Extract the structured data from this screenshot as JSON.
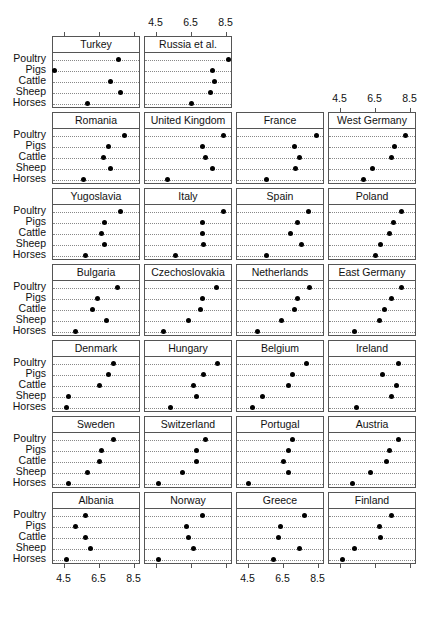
{
  "chart_data": {
    "type": "dot",
    "title": "",
    "xlabel": "",
    "ylabel": "",
    "xlim": [
      3.9,
      8.7
    ],
    "x_ticks": [
      4.5,
      6.5,
      8.5
    ],
    "x_tick_labels": [
      "4.5",
      "6.5",
      "8.5"
    ],
    "grid": "dotted horizontal per category",
    "categories": [
      "Poultry",
      "Pigs",
      "Cattle",
      "Sheep",
      "Horses"
    ],
    "layout": {
      "columns": 4,
      "rows": 7
    },
    "panels": [
      {
        "name": "Turkey",
        "values": {
          "Poultry": 7.6,
          "Pigs": 3.9,
          "Cattle": 7.1,
          "Sheep": 7.7,
          "Horses": 5.8
        }
      },
      {
        "name": "Russia et al.",
        "values": {
          "Poultry": 8.6,
          "Pigs": 7.7,
          "Cattle": 7.8,
          "Sheep": 7.6,
          "Horses": 6.5
        }
      },
      {
        "name": "Romania",
        "values": {
          "Poultry": 7.9,
          "Pigs": 7.0,
          "Cattle": 6.7,
          "Sheep": 7.1,
          "Horses": 5.6
        }
      },
      {
        "name": "United Kingdom",
        "values": {
          "Poultry": 8.3,
          "Pigs": 7.1,
          "Cattle": 7.3,
          "Sheep": 7.7,
          "Horses": 5.1
        }
      },
      {
        "name": "France",
        "values": {
          "Poultry": 8.4,
          "Pigs": 7.1,
          "Cattle": 7.4,
          "Sheep": 7.2,
          "Horses": 5.5
        }
      },
      {
        "name": "West Germany",
        "values": {
          "Poultry": 8.2,
          "Pigs": 7.6,
          "Cattle": 7.4,
          "Sheep": 6.3,
          "Horses": 5.8
        }
      },
      {
        "name": "Yugoslavia",
        "values": {
          "Poultry": 7.7,
          "Pigs": 6.8,
          "Cattle": 6.6,
          "Sheep": 6.8,
          "Horses": 5.7
        }
      },
      {
        "name": "Italy",
        "values": {
          "Poultry": 8.3,
          "Pigs": 7.1,
          "Cattle": 7.1,
          "Sheep": 7.2,
          "Horses": 5.6
        }
      },
      {
        "name": "Spain",
        "values": {
          "Poultry": 7.9,
          "Pigs": 7.3,
          "Cattle": 6.9,
          "Sheep": 7.5,
          "Horses": 5.5
        }
      },
      {
        "name": "Poland",
        "values": {
          "Poultry": 8.0,
          "Pigs": 7.5,
          "Cattle": 7.3,
          "Sheep": 6.8,
          "Horses": 6.5
        }
      },
      {
        "name": "Bulgaria",
        "values": {
          "Poultry": 7.5,
          "Pigs": 6.4,
          "Cattle": 6.1,
          "Sheep": 6.9,
          "Horses": 5.1
        }
      },
      {
        "name": "Czechoslovakia",
        "values": {
          "Poultry": 7.9,
          "Pigs": 7.1,
          "Cattle": 7.0,
          "Sheep": 6.3,
          "Horses": 4.9
        }
      },
      {
        "name": "Netherlands",
        "values": {
          "Poultry": 8.0,
          "Pigs": 7.3,
          "Cattle": 7.1,
          "Sheep": 6.4,
          "Horses": 5.0
        }
      },
      {
        "name": "East Germany",
        "values": {
          "Poultry": 8.0,
          "Pigs": 7.4,
          "Cattle": 7.0,
          "Sheep": 6.7,
          "Horses": 5.3
        }
      },
      {
        "name": "Denmark",
        "values": {
          "Poultry": 7.3,
          "Pigs": 7.0,
          "Cattle": 6.5,
          "Sheep": 4.7,
          "Horses": 4.6
        }
      },
      {
        "name": "Hungary",
        "values": {
          "Poultry": 8.0,
          "Pigs": 7.2,
          "Cattle": 6.6,
          "Sheep": 6.8,
          "Horses": 5.3
        }
      },
      {
        "name": "Belgium",
        "values": {
          "Poultry": 7.8,
          "Pigs": 7.0,
          "Cattle": 6.8,
          "Sheep": 5.3,
          "Horses": 4.7
        }
      },
      {
        "name": "Ireland",
        "values": {
          "Poultry": 7.8,
          "Pigs": 6.9,
          "Cattle": 7.7,
          "Sheep": 7.4,
          "Horses": 5.4
        }
      },
      {
        "name": "Sweden",
        "values": {
          "Poultry": 7.3,
          "Pigs": 6.6,
          "Cattle": 6.5,
          "Sheep": 5.8,
          "Horses": 4.7
        }
      },
      {
        "name": "Switzerland",
        "values": {
          "Poultry": 7.3,
          "Pigs": 6.8,
          "Cattle": 6.8,
          "Sheep": 6.0,
          "Horses": 4.6
        }
      },
      {
        "name": "Portugal",
        "values": {
          "Poultry": 7.0,
          "Pigs": 6.8,
          "Cattle": 6.5,
          "Sheep": 6.8,
          "Horses": 4.5
        }
      },
      {
        "name": "Austria",
        "values": {
          "Poultry": 7.8,
          "Pigs": 7.3,
          "Cattle": 7.1,
          "Sheep": 6.2,
          "Horses": 5.2
        }
      },
      {
        "name": "Albania",
        "values": {
          "Poultry": 5.7,
          "Pigs": 5.1,
          "Cattle": 5.7,
          "Sheep": 6.0,
          "Horses": 4.6
        }
      },
      {
        "name": "Norway",
        "values": {
          "Poultry": 7.1,
          "Pigs": 6.2,
          "Cattle": 6.3,
          "Sheep": 6.6,
          "Horses": 4.6
        }
      },
      {
        "name": "Greece",
        "values": {
          "Poultry": 7.7,
          "Pigs": 6.3,
          "Cattle": 6.2,
          "Sheep": 7.4,
          "Horses": 5.9
        }
      },
      {
        "name": "Finland",
        "values": {
          "Poultry": 7.4,
          "Pigs": 6.7,
          "Cattle": 6.8,
          "Sheep": 5.3,
          "Horses": 4.6
        }
      }
    ]
  }
}
